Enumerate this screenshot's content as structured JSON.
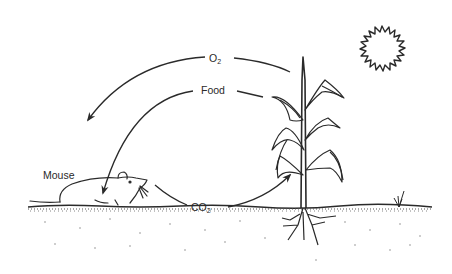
{
  "diagram": {
    "labels": {
      "oxygen": {
        "base": "O",
        "sub": "2"
      },
      "food": "Food",
      "carbon_dioxide": {
        "base": "CO",
        "sub": "2"
      },
      "mouse": "Mouse"
    },
    "flows": [
      {
        "label": "O2",
        "from": "plant",
        "to": "mouse"
      },
      {
        "label": "Food",
        "from": "plant",
        "to": "mouse"
      },
      {
        "label": "CO2",
        "from": "mouse",
        "to": "plant"
      }
    ],
    "elements": [
      "sun",
      "plant",
      "mouse",
      "ground",
      "weed"
    ],
    "colors": {
      "ink": "#2a2a2a",
      "background": "#ffffff"
    }
  }
}
